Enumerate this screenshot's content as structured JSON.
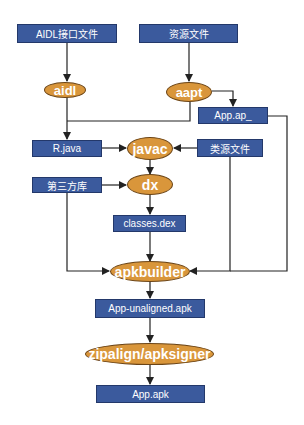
{
  "diagram": {
    "title": "",
    "colors": {
      "box_fill": "#3b5a9d",
      "box_border": "#23386a",
      "tool_fill": "#d9963b",
      "tool_border": "#6b4416",
      "line": "#222222",
      "text": "#ffffff"
    },
    "nodes": {
      "aidl_files": "AIDL接口文件",
      "resource_files": "资源文件",
      "aidl_tool": "aidl",
      "aapt_tool": "aapt",
      "app_ap": "App.ap_",
      "r_java": "R.java",
      "javac_tool": "javac",
      "java_source": "类源文件",
      "third_party_lib": "第三方库",
      "dx_tool": "dx",
      "classes_dex": "classes.dex",
      "apkbuilder_tool": "apkbuilder",
      "unaligned_apk": "App-unaligned.apk",
      "zipalign_tool": "zipalign/apksigner",
      "final_apk": "App.apk"
    },
    "edges": [
      [
        "AIDL接口文件",
        "aidl"
      ],
      [
        "资源文件",
        "aapt"
      ],
      [
        "aidl",
        "R.java"
      ],
      [
        "aapt",
        "R.java"
      ],
      [
        "aapt",
        "App.ap_"
      ],
      [
        "R.java",
        "javac"
      ],
      [
        "类源文件",
        "javac"
      ],
      [
        "javac",
        "dx"
      ],
      [
        "第三方库",
        "dx"
      ],
      [
        "dx",
        "classes.dex"
      ],
      [
        "classes.dex",
        "apkbuilder"
      ],
      [
        "第三方库",
        "apkbuilder"
      ],
      [
        "类源文件",
        "apkbuilder"
      ],
      [
        "App.ap_",
        "apkbuilder"
      ],
      [
        "apkbuilder",
        "App-unaligned.apk"
      ],
      [
        "App-unaligned.apk",
        "zipalign/apksigner"
      ],
      [
        "zipalign/apksigner",
        "App.apk"
      ]
    ]
  }
}
